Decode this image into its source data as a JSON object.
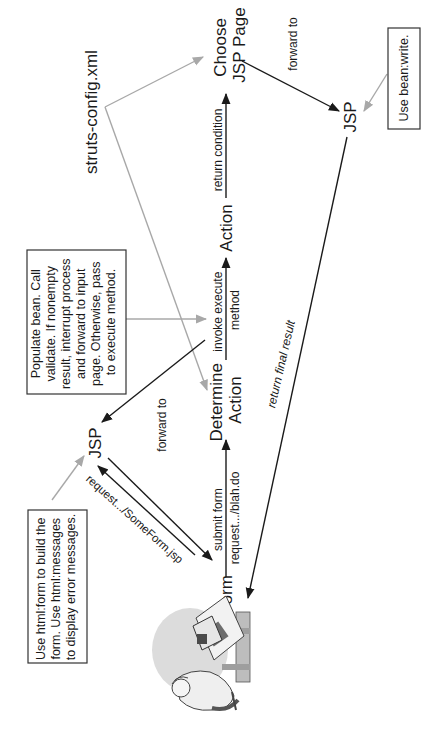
{
  "diagram": {
    "orientation": "rotated-90-ccw",
    "nodes": {
      "form": "Form",
      "jsp_input": "JSP",
      "determine_action": [
        "Determine",
        "Action"
      ],
      "action": "Action",
      "choose_jsp": [
        "Choose",
        "JSP Page"
      ],
      "jsp_output": "JSP",
      "struts_config": "struts-config.xml"
    },
    "edges": {
      "request_jsp": "request.../SomeForm.jsp",
      "forward_to_jsp_input": "forward to",
      "submit_form": [
        "submit form",
        "request.../blah.do"
      ],
      "invoke_execute": [
        "invoke execute",
        "method"
      ],
      "return_condition": "return condition",
      "forward_to_jsp_output": "forward to",
      "return_final_result": "return final result"
    },
    "notes": {
      "html_form_note": [
        "Use html:form to build the",
        "form. Use html:messages",
        "to display error messages."
      ],
      "populate_note": [
        "Populate bean. Call",
        "validate. If nonempty",
        "result, interrupt process",
        "and forward to input",
        "page. Otherwise, pass",
        "to execute method."
      ],
      "bean_write_note": "Use bean:write."
    },
    "colors": {
      "primary_arrow": "#1a1a1a",
      "secondary_arrow": "#a8a8a8",
      "box_border": "#333333",
      "background": "#ffffff"
    }
  }
}
